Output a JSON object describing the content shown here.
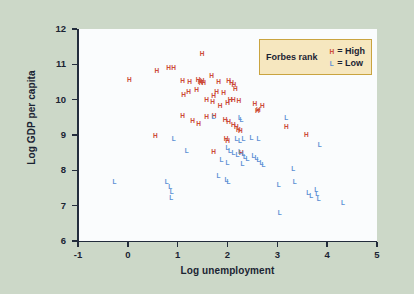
{
  "chart_data": {
    "type": "scatter",
    "title": "",
    "xlabel": "Log unemployment",
    "ylabel": "Log GDP per capita",
    "xlim": [
      -1,
      5
    ],
    "ylim": [
      6,
      12
    ],
    "xticks": [
      "-1",
      "0",
      "1",
      "2",
      "3",
      "4",
      "5"
    ],
    "yticks": [
      "6",
      "7",
      "8",
      "9",
      "10",
      "11",
      "12"
    ],
    "grid": false,
    "legend": {
      "position": "top-right",
      "title": "Forbes rank",
      "entries": [
        {
          "marker": "H",
          "label": "= High",
          "color": "#cc4a38"
        },
        {
          "marker": "L",
          "label": "= Low",
          "color": "#5b8fd4"
        }
      ]
    },
    "colors": {
      "high": "#cc4a38",
      "low": "#5b8fd4",
      "figure_background": "#ccd8c8",
      "plot_background": "#fafcfd",
      "axis": "#232d3d",
      "legend_fill": "#f6e7bf",
      "legend_border": "#c9a440"
    },
    "series": [
      {
        "name": "High",
        "marker": "H",
        "color": "#cc4a38",
        "points": [
          [
            0.03,
            10.55
          ],
          [
            0.58,
            10.8
          ],
          [
            0.82,
            10.9
          ],
          [
            0.92,
            10.9
          ],
          [
            1.49,
            11.28
          ],
          [
            1.1,
            10.52
          ],
          [
            1.24,
            10.5
          ],
          [
            1.41,
            10.55
          ],
          [
            1.45,
            10.5
          ],
          [
            1.47,
            10.47
          ],
          [
            1.49,
            10.52
          ],
          [
            1.52,
            10.48
          ],
          [
            1.68,
            10.68
          ],
          [
            1.82,
            10.5
          ],
          [
            2.02,
            10.52
          ],
          [
            2.08,
            10.48
          ],
          [
            2.13,
            10.42
          ],
          [
            2.16,
            10.3
          ],
          [
            1.12,
            10.12
          ],
          [
            1.22,
            10.22
          ],
          [
            1.38,
            10.28
          ],
          [
            1.58,
            10.0
          ],
          [
            1.72,
            10.1
          ],
          [
            1.78,
            10.22
          ],
          [
            1.92,
            10.18
          ],
          [
            2.05,
            9.98
          ],
          [
            2.12,
            10.0
          ],
          [
            1.7,
            9.92
          ],
          [
            1.85,
            9.83
          ],
          [
            2.0,
            9.9
          ],
          [
            2.23,
            9.95
          ],
          [
            2.55,
            9.88
          ],
          [
            2.62,
            9.72
          ],
          [
            2.7,
            9.82
          ],
          [
            1.1,
            9.55
          ],
          [
            1.3,
            9.4
          ],
          [
            1.42,
            9.3
          ],
          [
            1.58,
            9.52
          ],
          [
            1.73,
            9.55
          ],
          [
            1.95,
            9.42
          ],
          [
            2.02,
            9.38
          ],
          [
            2.12,
            9.28
          ],
          [
            2.18,
            9.22
          ],
          [
            2.22,
            9.15
          ],
          [
            2.26,
            9.1
          ],
          [
            2.6,
            9.68
          ],
          [
            3.18,
            9.22
          ],
          [
            0.55,
            8.98
          ],
          [
            1.97,
            8.9
          ],
          [
            2.0,
            8.82
          ],
          [
            1.72,
            8.52
          ],
          [
            2.28,
            8.48
          ],
          [
            3.58,
            9.0
          ]
        ]
      },
      {
        "name": "Low",
        "marker": "L",
        "color": "#5b8fd4",
        "points": [
          [
            1.72,
            9.52
          ],
          [
            2.25,
            9.48
          ],
          [
            2.28,
            9.42
          ],
          [
            3.18,
            9.48
          ],
          [
            2.18,
            8.88
          ],
          [
            2.25,
            8.82
          ],
          [
            2.32,
            8.88
          ],
          [
            2.48,
            8.92
          ],
          [
            2.62,
            8.9
          ],
          [
            3.85,
            8.72
          ],
          [
            2.0,
            8.62
          ],
          [
            2.05,
            8.55
          ],
          [
            2.12,
            8.48
          ],
          [
            2.2,
            8.42
          ],
          [
            2.25,
            8.52
          ],
          [
            2.32,
            8.45
          ],
          [
            2.35,
            8.38
          ],
          [
            2.4,
            8.32
          ],
          [
            2.52,
            8.4
          ],
          [
            2.58,
            8.35
          ],
          [
            2.62,
            8.28
          ],
          [
            2.68,
            8.22
          ],
          [
            1.18,
            8.55
          ],
          [
            1.88,
            8.3
          ],
          [
            2.0,
            8.22
          ],
          [
            2.3,
            8.18
          ],
          [
            2.72,
            8.15
          ],
          [
            3.32,
            8.05
          ],
          [
            0.92,
            8.88
          ],
          [
            1.82,
            7.85
          ],
          [
            1.98,
            7.72
          ],
          [
            2.02,
            7.68
          ],
          [
            -0.27,
            7.68
          ],
          [
            0.78,
            7.68
          ],
          [
            0.85,
            7.52
          ],
          [
            0.88,
            7.38
          ],
          [
            0.87,
            7.22
          ],
          [
            3.03,
            7.58
          ],
          [
            3.35,
            7.68
          ],
          [
            3.62,
            7.35
          ],
          [
            3.68,
            7.28
          ],
          [
            3.78,
            7.45
          ],
          [
            3.8,
            7.32
          ],
          [
            3.83,
            7.18
          ],
          [
            4.32,
            7.08
          ],
          [
            3.05,
            6.78
          ]
        ]
      }
    ]
  }
}
